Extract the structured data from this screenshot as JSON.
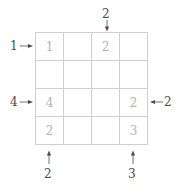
{
  "puzzle": {
    "type": "grid-puzzle",
    "rows": 4,
    "cols": 4,
    "grid_line_color": "#cfcfcf",
    "cell_value_color": "#b4b4b4",
    "clue_color": "#4a4a4a",
    "background": "#ffffff",
    "cells": [
      [
        {
          "value": "1"
        },
        {
          "value": ""
        },
        {
          "value": "2"
        },
        {
          "value": ""
        }
      ],
      [
        {
          "value": ""
        },
        {
          "value": ""
        },
        {
          "value": ""
        },
        {
          "value": ""
        }
      ],
      [
        {
          "value": "4"
        },
        {
          "value": ""
        },
        {
          "value": ""
        },
        {
          "value": "2"
        }
      ],
      [
        {
          "value": "2"
        },
        {
          "value": ""
        },
        {
          "value": ""
        },
        {
          "value": "3"
        }
      ]
    ],
    "clues": [
      {
        "id": "top-col3",
        "label": "2",
        "side": "top",
        "index": 3,
        "direction": "down"
      },
      {
        "id": "left-row1",
        "label": "1",
        "side": "left",
        "index": 1,
        "direction": "right"
      },
      {
        "id": "left-row3",
        "label": "4",
        "side": "left",
        "index": 3,
        "direction": "right"
      },
      {
        "id": "right-row3",
        "label": "2",
        "side": "right",
        "index": 3,
        "direction": "left"
      },
      {
        "id": "bottom-col1",
        "label": "2",
        "side": "bottom",
        "index": 1,
        "direction": "up"
      },
      {
        "id": "bottom-col4",
        "label": "3",
        "side": "bottom",
        "index": 4,
        "direction": "up"
      }
    ]
  }
}
